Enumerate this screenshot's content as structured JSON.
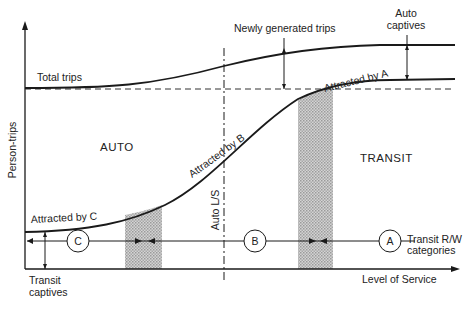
{
  "diagram": {
    "axes": {
      "y_label": "Person-trips",
      "x_label": "Level of Service"
    },
    "curves": {
      "total_trips_label": "Total trips",
      "newly_generated_label": "Newly generated trips",
      "auto_captives_label_line1": "Auto",
      "auto_captives_label_line2": "captives",
      "attracted_a_label": "Attracted by A",
      "attracted_b_label": "Attracted by B",
      "attracted_c_label": "Attracted by C"
    },
    "regions": {
      "auto_label": "AUTO",
      "transit_label": "TRANSIT"
    },
    "auto_ls_label": "Auto L/S",
    "categories": {
      "c": "C",
      "b": "B",
      "a": "A",
      "legend_line1": "Transit R/W",
      "legend_line2": "categories"
    },
    "transit_captives_line1": "Transit",
    "transit_captives_line2": "captives",
    "colors": {
      "line": "#1a1a1a",
      "shade": "#bdbdbd"
    }
  }
}
